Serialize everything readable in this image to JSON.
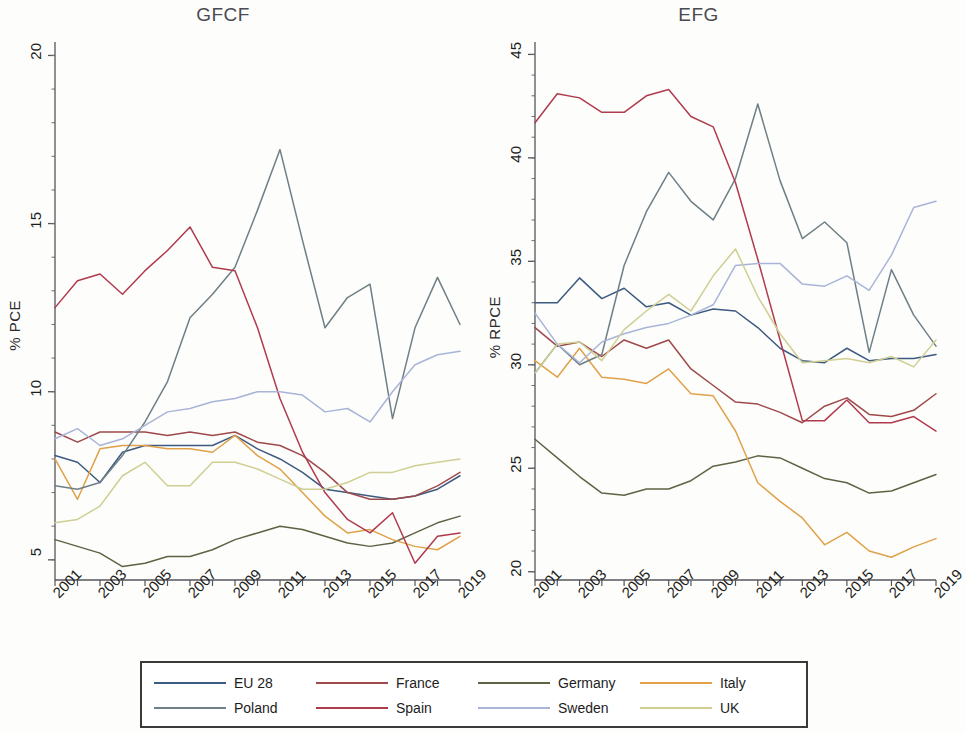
{
  "figure": {
    "legend_border_color": "#3a3a3a",
    "background": "#fdfdfb"
  },
  "legend": {
    "entries": [
      {
        "label": "EU 28",
        "color": "#3d5a80"
      },
      {
        "label": "France",
        "color": "#9e4a4a"
      },
      {
        "label": "Germany",
        "color": "#5e6344"
      },
      {
        "label": "Italy",
        "color": "#e0a149"
      },
      {
        "label": "Poland",
        "color": "#6f7f86"
      },
      {
        "label": "Spain",
        "color": "#b03a4e"
      },
      {
        "label": "Sweden",
        "color": "#a9b4d8"
      },
      {
        "label": "UK",
        "color": "#cfcf93"
      }
    ]
  },
  "chart_data": [
    {
      "type": "line",
      "title": "GFCF",
      "xlabel": "",
      "ylabel": "% PCE",
      "x": [
        2001,
        2002,
        2003,
        2004,
        2005,
        2006,
        2007,
        2008,
        2009,
        2010,
        2011,
        2012,
        2013,
        2014,
        2015,
        2016,
        2017,
        2018,
        2019
      ],
      "xticks": [
        2001,
        2003,
        2005,
        2007,
        2009,
        2011,
        2013,
        2015,
        2017,
        2019
      ],
      "xlim": [
        2001,
        2019
      ],
      "ylim": [
        4.4,
        20.4
      ],
      "yticks": [
        5,
        10,
        15,
        20
      ],
      "grid": false,
      "legend_position": "below-figure",
      "series": [
        {
          "name": "EU 28",
          "color": "#3d5a80",
          "values": [
            8.1,
            7.9,
            7.3,
            8.2,
            8.4,
            8.4,
            8.4,
            8.4,
            8.7,
            8.3,
            8.0,
            7.6,
            7.1,
            7.0,
            6.9,
            6.8,
            6.9,
            7.1,
            7.5
          ]
        },
        {
          "name": "France",
          "color": "#9e4a4a",
          "values": [
            8.8,
            8.5,
            8.8,
            8.8,
            8.8,
            8.7,
            8.8,
            8.7,
            8.8,
            8.5,
            8.4,
            8.1,
            7.6,
            7.0,
            6.8,
            6.8,
            6.9,
            7.2,
            7.6
          ]
        },
        {
          "name": "Germany",
          "color": "#5e6344",
          "values": [
            5.6,
            5.4,
            5.2,
            4.8,
            4.9,
            5.1,
            5.1,
            5.3,
            5.6,
            5.8,
            6.0,
            5.9,
            5.7,
            5.5,
            5.4,
            5.5,
            5.8,
            6.1,
            6.3
          ]
        },
        {
          "name": "Italy",
          "color": "#e0a149",
          "values": [
            8.0,
            6.8,
            8.3,
            8.4,
            8.4,
            8.3,
            8.3,
            8.2,
            8.7,
            8.1,
            7.7,
            7.0,
            6.3,
            5.8,
            5.9,
            5.6,
            5.4,
            5.3,
            5.7
          ]
        },
        {
          "name": "Poland",
          "color": "#6f7f86",
          "values": [
            7.2,
            7.1,
            7.3,
            8.1,
            9.1,
            10.3,
            12.2,
            12.9,
            13.7,
            15.4,
            17.2,
            14.5,
            11.9,
            12.8,
            13.2,
            9.2,
            11.9,
            13.4,
            12.0
          ]
        },
        {
          "name": "Spain",
          "color": "#b03a4e",
          "values": [
            12.5,
            13.3,
            13.5,
            12.9,
            13.6,
            14.2,
            14.9,
            13.7,
            13.6,
            11.9,
            9.8,
            8.2,
            7.0,
            6.2,
            5.8,
            6.4,
            4.9,
            5.7,
            5.8
          ]
        },
        {
          "name": "Sweden",
          "color": "#a9b4d8",
          "values": [
            8.6,
            8.9,
            8.4,
            8.6,
            9.0,
            9.4,
            9.5,
            9.7,
            9.8,
            10.0,
            10.0,
            9.9,
            9.4,
            9.5,
            9.1,
            10.0,
            10.8,
            11.1,
            11.2
          ]
        },
        {
          "name": "UK",
          "color": "#cfcf93",
          "values": [
            6.1,
            6.2,
            6.6,
            7.5,
            7.9,
            7.2,
            7.2,
            7.9,
            7.9,
            7.7,
            7.4,
            7.1,
            7.1,
            7.3,
            7.6,
            7.6,
            7.8,
            7.9,
            8.0
          ]
        }
      ]
    },
    {
      "type": "line",
      "title": "EFG",
      "xlabel": "",
      "ylabel": "% RPCE",
      "x": [
        2001,
        2002,
        2003,
        2004,
        2005,
        2006,
        2007,
        2008,
        2009,
        2010,
        2011,
        2012,
        2013,
        2014,
        2015,
        2016,
        2017,
        2018,
        2019
      ],
      "xticks": [
        2001,
        2003,
        2005,
        2007,
        2009,
        2011,
        2013,
        2015,
        2017,
        2019
      ],
      "xlim": [
        2001,
        2019
      ],
      "ylim": [
        19.6,
        45.6
      ],
      "yticks": [
        20,
        25,
        30,
        35,
        40,
        45
      ],
      "grid": false,
      "legend_position": "below-figure",
      "series": [
        {
          "name": "EU 28",
          "color": "#3d5a80",
          "values": [
            33.0,
            33.0,
            34.2,
            33.2,
            33.7,
            32.8,
            33.0,
            32.4,
            32.7,
            32.6,
            31.8,
            30.8,
            30.2,
            30.1,
            30.8,
            30.2,
            30.3,
            30.3,
            30.5
          ]
        },
        {
          "name": "France",
          "color": "#9e4a4a",
          "values": [
            31.8,
            30.9,
            31.1,
            30.4,
            31.2,
            30.8,
            31.2,
            29.8,
            29.0,
            28.2,
            28.1,
            27.7,
            27.2,
            28.0,
            28.4,
            27.6,
            27.5,
            27.8,
            28.6
          ]
        },
        {
          "name": "Germany",
          "color": "#5e6344",
          "values": [
            26.4,
            25.5,
            24.6,
            23.8,
            23.7,
            24.0,
            24.0,
            24.4,
            25.1,
            25.3,
            25.6,
            25.5,
            25.0,
            24.5,
            24.3,
            23.8,
            23.9,
            24.3,
            24.7
          ]
        },
        {
          "name": "Italy",
          "color": "#e0a149",
          "values": [
            30.2,
            29.4,
            30.8,
            29.4,
            29.3,
            29.1,
            29.8,
            28.6,
            28.5,
            26.8,
            24.3,
            23.4,
            22.6,
            21.3,
            21.9,
            21.0,
            20.7,
            21.2,
            21.6
          ]
        },
        {
          "name": "Poland",
          "color": "#6f7f86",
          "values": [
            29.6,
            31.0,
            30.0,
            30.5,
            34.8,
            37.4,
            39.3,
            37.9,
            37.0,
            39.0,
            42.6,
            38.9,
            36.1,
            36.9,
            35.9,
            30.6,
            34.6,
            32.4,
            30.9
          ]
        },
        {
          "name": "Spain",
          "color": "#b03a4e",
          "values": [
            41.7,
            43.1,
            42.9,
            42.2,
            42.2,
            43.0,
            43.3,
            42.0,
            41.5,
            38.8,
            35.1,
            31.2,
            27.3,
            27.3,
            28.3,
            27.2,
            27.2,
            27.5,
            26.8
          ]
        },
        {
          "name": "Sweden",
          "color": "#a9b4d8",
          "values": [
            32.5,
            31.0,
            30.1,
            31.1,
            31.5,
            31.8,
            32.0,
            32.4,
            32.9,
            34.8,
            34.9,
            34.9,
            33.9,
            33.8,
            34.3,
            33.6,
            35.3,
            37.6,
            37.9
          ]
        },
        {
          "name": "UK",
          "color": "#cfcf93",
          "values": [
            29.6,
            31.0,
            31.1,
            30.2,
            31.7,
            32.6,
            33.4,
            32.6,
            34.3,
            35.6,
            33.3,
            31.5,
            30.1,
            30.2,
            30.3,
            30.1,
            30.4,
            29.9,
            31.2
          ]
        }
      ]
    }
  ]
}
